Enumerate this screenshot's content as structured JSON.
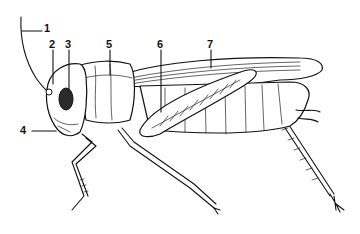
{
  "diagram": {
    "labels": [
      {
        "id": "1",
        "text": "1"
      },
      {
        "id": "2",
        "text": "2"
      },
      {
        "id": "3",
        "text": "3"
      },
      {
        "id": "4",
        "text": "4"
      },
      {
        "id": "5",
        "text": "5"
      },
      {
        "id": "6",
        "text": "6"
      },
      {
        "id": "7",
        "text": "7"
      }
    ],
    "colors": {
      "ink": "#111111",
      "background": "#ffffff",
      "eye": "#2a2a2a"
    }
  }
}
